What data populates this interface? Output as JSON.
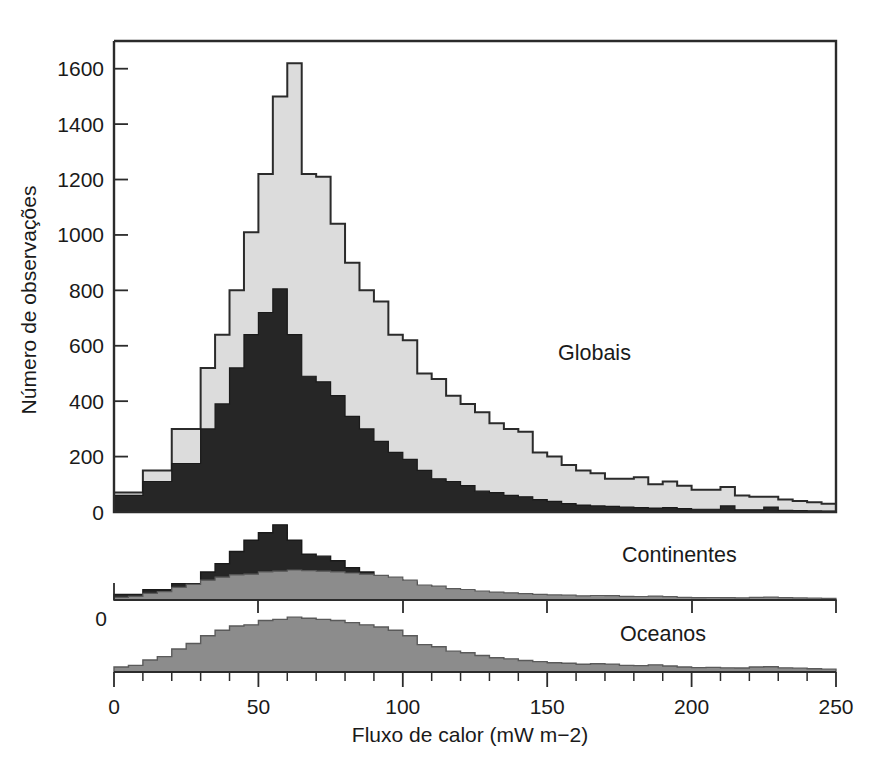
{
  "chart_data": {
    "type": "bar",
    "title": "",
    "subtitle": "",
    "xlabel": "Fluxo de calor (mW m−2)",
    "ylabel": "Número de observações",
    "xlim": [
      0,
      250
    ],
    "ylim": [
      0,
      1700
    ],
    "grid": false,
    "legend_position": "inline-annotation",
    "bin_width": 5,
    "x_major_ticks": [
      0,
      50,
      100,
      150,
      200,
      250
    ],
    "x_major_tick_labels": [
      "0",
      "50",
      "100",
      "150",
      "200",
      "250"
    ],
    "x_minor_tick_step": 10,
    "y_major_ticks": [
      0,
      200,
      400,
      600,
      800,
      1000,
      1200,
      1400,
      1600
    ],
    "y_major_tick_labels": [
      "0",
      "200",
      "400",
      "600",
      "800",
      "1000",
      "1200",
      "1400",
      "1600"
    ],
    "panels": [
      {
        "name": "globais",
        "label": "Globais",
        "label_x": 128,
        "fill_color": "#dcdcdc",
        "edge_color": "#2b2b2b",
        "axis_zero_label": "0",
        "note": "Histogram of all global heat-flow observations, 5 mW/m^2 bins from 0 to 250.",
        "bin_starts": [
          0,
          5,
          10,
          15,
          20,
          25,
          30,
          35,
          40,
          45,
          50,
          55,
          60,
          65,
          70,
          75,
          80,
          85,
          90,
          95,
          100,
          105,
          110,
          115,
          120,
          125,
          130,
          135,
          140,
          145,
          150,
          155,
          160,
          165,
          170,
          175,
          180,
          185,
          190,
          195,
          200,
          205,
          210,
          215,
          220,
          225,
          230,
          235,
          240,
          245
        ],
        "values": [
          70,
          70,
          150,
          150,
          300,
          300,
          520,
          640,
          800,
          1010,
          1220,
          1500,
          1620,
          1220,
          1210,
          1040,
          900,
          800,
          760,
          640,
          620,
          500,
          480,
          420,
          390,
          360,
          320,
          300,
          290,
          215,
          200,
          170,
          150,
          140,
          120,
          120,
          125,
          100,
          110,
          95,
          80,
          80,
          90,
          60,
          55,
          55,
          45,
          40,
          35,
          30
        ]
      },
      {
        "name": "continentes",
        "label": "Continentes",
        "label_x": 150,
        "fill_color": "#262626",
        "edge_color": "#1a1a1a",
        "axis_zero_label": "0",
        "note": "Continental heat-flow observations, same 5 mW/m^2 bins.",
        "bin_starts": [
          0,
          5,
          10,
          15,
          20,
          25,
          30,
          35,
          40,
          45,
          50,
          55,
          60,
          65,
          70,
          75,
          80,
          85,
          90,
          95,
          100,
          105,
          110,
          115,
          120,
          125,
          130,
          135,
          140,
          145,
          150,
          155,
          160,
          165,
          170,
          175,
          180,
          185,
          190,
          195,
          200,
          205,
          210,
          215,
          220,
          225,
          230,
          235,
          240,
          245
        ],
        "values": [
          60,
          60,
          110,
          110,
          175,
          175,
          300,
          390,
          520,
          640,
          720,
          805,
          640,
          490,
          470,
          420,
          345,
          300,
          255,
          215,
          190,
          150,
          120,
          110,
          95,
          75,
          70,
          60,
          55,
          45,
          38,
          30,
          25,
          22,
          20,
          18,
          16,
          14,
          16,
          12,
          10,
          10,
          22,
          8,
          8,
          18,
          6,
          5,
          4,
          3
        ]
      },
      {
        "name": "oceanos",
        "label": "Oceanos",
        "label_x": 148,
        "fill_color": "#8c8c8c",
        "edge_color": "#5a5a5a",
        "axis_zero_label": "",
        "note": "Oceanic heat-flow observations, same 5 mW/m^2 bins.",
        "bin_starts": [
          0,
          5,
          10,
          15,
          20,
          25,
          30,
          35,
          40,
          45,
          50,
          55,
          60,
          65,
          70,
          75,
          80,
          85,
          90,
          95,
          100,
          105,
          110,
          115,
          120,
          125,
          130,
          135,
          140,
          145,
          150,
          155,
          160,
          165,
          170,
          175,
          180,
          185,
          190,
          195,
          200,
          205,
          210,
          215,
          220,
          225,
          230,
          235,
          240,
          245
        ],
        "values": [
          45,
          60,
          110,
          140,
          210,
          260,
          330,
          380,
          420,
          430,
          470,
          480,
          500,
          490,
          480,
          470,
          450,
          430,
          410,
          380,
          330,
          250,
          230,
          190,
          175,
          150,
          130,
          120,
          105,
          95,
          85,
          80,
          70,
          75,
          72,
          60,
          58,
          65,
          55,
          45,
          40,
          42,
          38,
          36,
          45,
          48,
          38,
          35,
          30,
          26
        ]
      }
    ],
    "series": [
      {
        "name": "Globais",
        "values": [
          70,
          70,
          150,
          150,
          300,
          300,
          520,
          640,
          800,
          1010,
          1220,
          1500,
          1620,
          1220,
          1210,
          1040,
          900,
          800,
          760,
          640,
          620,
          500,
          480,
          420,
          390,
          360,
          320,
          300,
          290,
          215,
          200,
          170,
          150,
          140,
          120,
          120,
          125,
          100,
          110,
          95,
          80,
          80,
          90,
          60,
          55,
          55,
          45,
          40,
          35,
          30
        ]
      },
      {
        "name": "Continentes",
        "values": [
          60,
          60,
          110,
          110,
          175,
          175,
          300,
          390,
          520,
          640,
          720,
          805,
          640,
          490,
          470,
          420,
          345,
          300,
          255,
          215,
          190,
          150,
          120,
          110,
          95,
          75,
          70,
          60,
          55,
          45,
          38,
          30,
          25,
          22,
          20,
          18,
          16,
          14,
          16,
          12,
          10,
          10,
          22,
          8,
          8,
          18,
          6,
          5,
          4,
          3
        ]
      },
      {
        "name": "Oceanos",
        "values": [
          45,
          60,
          110,
          140,
          210,
          260,
          330,
          380,
          420,
          430,
          470,
          480,
          500,
          490,
          480,
          470,
          450,
          430,
          410,
          380,
          330,
          250,
          230,
          190,
          175,
          150,
          130,
          120,
          105,
          95,
          85,
          80,
          70,
          75,
          72,
          60,
          58,
          65,
          55,
          45,
          40,
          42,
          38,
          36,
          45,
          48,
          38,
          35,
          30,
          26
        ]
      }
    ]
  },
  "figure": {
    "background_color": "#ffffff",
    "axis_color": "#2b2b2b"
  }
}
